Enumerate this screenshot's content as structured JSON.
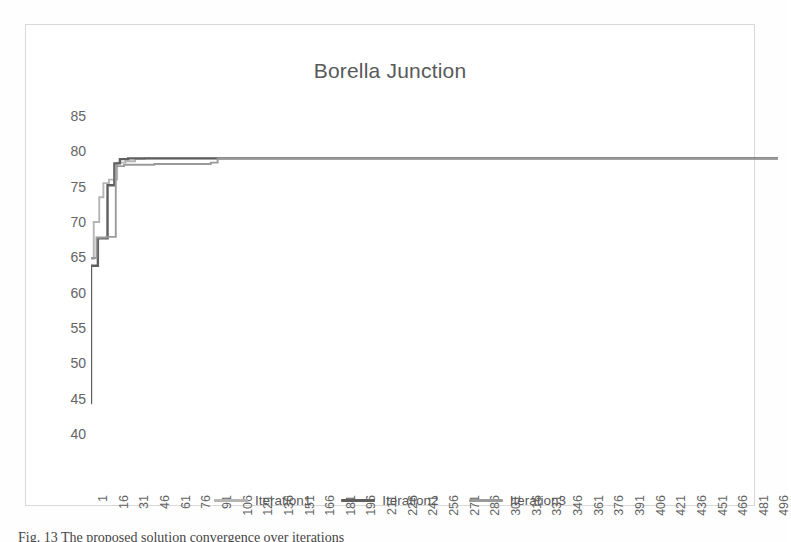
{
  "chart_data": {
    "type": "line",
    "title": "Borella Junction",
    "xlabel": "",
    "ylabel": "",
    "ylim": [
      40,
      85
    ],
    "yticks": [
      40,
      45,
      50,
      55,
      60,
      65,
      70,
      75,
      80,
      85
    ],
    "xticks": [
      1,
      16,
      31,
      46,
      61,
      76,
      91,
      106,
      121,
      136,
      151,
      166,
      181,
      196,
      211,
      226,
      241,
      256,
      271,
      286,
      301,
      316,
      331,
      346,
      361,
      376,
      391,
      406,
      421,
      436,
      451,
      466,
      481,
      496
    ],
    "xlim": [
      1,
      500
    ],
    "grid": false,
    "legend_position": "bottom",
    "series": [
      {
        "name": "Iteration1",
        "color": "#b5b5b5",
        "x": [
          1,
          3,
          3,
          7,
          7,
          10,
          10,
          14,
          14,
          20,
          20,
          26,
          26,
          33,
          33,
          40,
          40,
          500
        ],
        "y": [
          64.8,
          64.8,
          70.0,
          70.0,
          73.5,
          73.5,
          75.5,
          75.5,
          76.0,
          76.0,
          78.4,
          78.4,
          78.6,
          78.6,
          78.9,
          78.9,
          79.0,
          79.0
        ]
      },
      {
        "name": "Iteration2",
        "color": "#5f5f5f",
        "x": [
          1,
          1,
          6,
          6,
          13,
          13,
          18,
          18,
          22,
          22,
          28,
          28,
          36,
          36,
          500
        ],
        "y": [
          44.2,
          63.8,
          63.8,
          67.7,
          67.7,
          75.2,
          75.2,
          78.3,
          78.3,
          78.9,
          78.9,
          79.0,
          79.0,
          79.0,
          79.0
        ]
      },
      {
        "name": "Iteration3",
        "color": "#9a9a9a",
        "x": [
          1,
          5,
          5,
          12,
          12,
          19,
          19,
          25,
          25,
          47,
          47,
          88,
          88,
          93,
          93,
          500
        ],
        "y": [
          64.9,
          64.9,
          67.8,
          67.8,
          67.9,
          67.9,
          77.9,
          77.9,
          78.1,
          78.1,
          78.2,
          78.2,
          78.4,
          78.4,
          79.0,
          79.0
        ]
      }
    ]
  },
  "chart": {
    "title": "Borella Junction",
    "y_tick_labels": [
      "85",
      "80",
      "75",
      "70",
      "65",
      "60",
      "55",
      "50",
      "45",
      "40"
    ],
    "x_tick_labels": [
      "1",
      "16",
      "31",
      "46",
      "61",
      "76",
      "91",
      "106",
      "121",
      "136",
      "151",
      "166",
      "181",
      "196",
      "211",
      "226",
      "241",
      "256",
      "271",
      "286",
      "301",
      "316",
      "331",
      "346",
      "361",
      "376",
      "391",
      "406",
      "421",
      "436",
      "451",
      "466",
      "481",
      "496"
    ],
    "legend": [
      {
        "label": "Iteration1",
        "color": "#b5b5b5"
      },
      {
        "label": "Iteration2",
        "color": "#5f5f5f"
      },
      {
        "label": "Iteration3",
        "color": "#9a9a9a"
      }
    ]
  },
  "caption": {
    "text": "Fig. 13  The  proposed  solution  convergence  over  iterations"
  },
  "colors": {
    "frame_border": "#d8d8d8",
    "axis_text": "#646464",
    "title_text": "#595959",
    "background": "#ffffff"
  }
}
